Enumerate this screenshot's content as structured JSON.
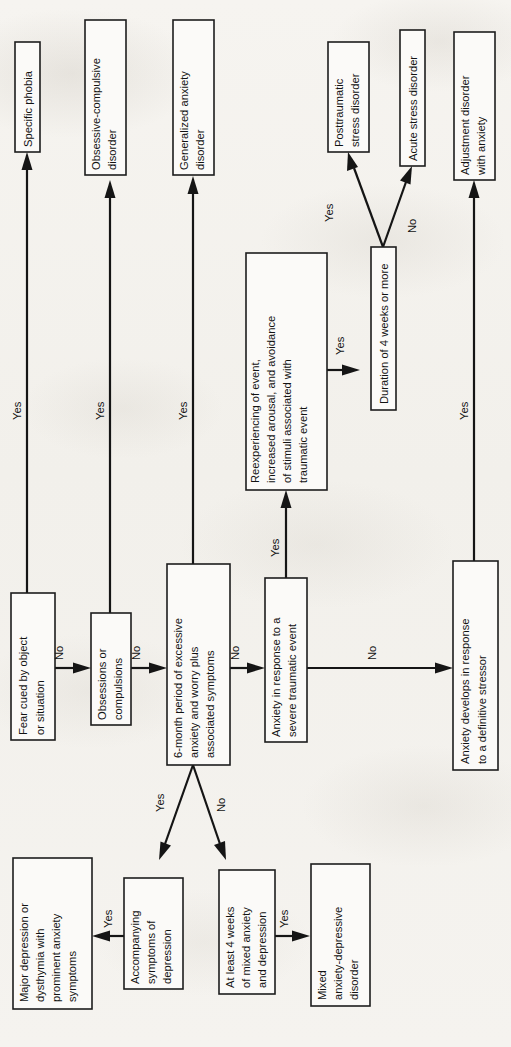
{
  "figure": {
    "orientation": "rotated-90-counterclockwise",
    "paper_color": "#f4f2ee",
    "ink_color": "#151515",
    "box_fill": "#fbfaf8"
  },
  "nodes": {
    "fear_cued": {
      "id": "fear_cued",
      "lines": [
        "Fear cued by object",
        "or situation"
      ],
      "kind": "decision"
    },
    "specific_phobia": {
      "id": "specific_phobia",
      "lines": [
        "Specific phobia"
      ],
      "kind": "outcome"
    },
    "obsessions": {
      "id": "obsessions",
      "lines": [
        "Obsessions or",
        "compulsions"
      ],
      "kind": "decision"
    },
    "ocd": {
      "id": "ocd",
      "lines": [
        "Obsessive-compulsive",
        "disorder"
      ],
      "kind": "outcome"
    },
    "six_month": {
      "id": "six_month",
      "lines": [
        "6-month period of excessive",
        "anxiety and worry plus",
        "associated symptoms"
      ],
      "kind": "decision"
    },
    "gad": {
      "id": "gad",
      "lines": [
        "Generalized anxiety",
        "disorder"
      ],
      "kind": "outcome"
    },
    "anxiety_trauma": {
      "id": "anxiety_trauma",
      "lines": [
        "Anxiety in response to a",
        "severe traumatic event"
      ],
      "kind": "decision"
    },
    "reexperiencing": {
      "id": "reexperiencing",
      "lines": [
        "Reexperiencing of event,",
        "increased arousal, and avoidance",
        "of stimuli associated with",
        "traumatic event"
      ],
      "kind": "decision"
    },
    "duration_4wk": {
      "id": "duration_4wk",
      "lines": [
        "Duration of 4 weeks or more"
      ],
      "kind": "decision"
    },
    "ptsd": {
      "id": "ptsd",
      "lines": [
        "Posttraumatic",
        "stress disorder"
      ],
      "kind": "outcome"
    },
    "acute_stress": {
      "id": "acute_stress",
      "lines": [
        "Acute stress disorder"
      ],
      "kind": "outcome"
    },
    "anxiety_stressor": {
      "id": "anxiety_stressor",
      "lines": [
        "Anxiety develops in response",
        "to a definitive stressor"
      ],
      "kind": "decision"
    },
    "adjustment": {
      "id": "adjustment",
      "lines": [
        "Adjustment disorder",
        "with anxiety"
      ],
      "kind": "outcome"
    },
    "accompanying_dep": {
      "id": "accompanying_dep",
      "lines": [
        "Accompanying",
        "symptoms of",
        "depression"
      ],
      "kind": "decision"
    },
    "major_depression": {
      "id": "major_depression",
      "lines": [
        "Major depression or",
        "dysthymia with",
        "prominent anxiety",
        "symptoms"
      ],
      "kind": "outcome"
    },
    "at_least_4wk": {
      "id": "at_least_4wk",
      "lines": [
        "At least 4 weeks",
        "of mixed anxiety",
        "and depression"
      ],
      "kind": "decision"
    },
    "mixed_disorder": {
      "id": "mixed_disorder",
      "lines": [
        "Mixed",
        "anxiety-depressive",
        "disorder"
      ],
      "kind": "outcome"
    }
  },
  "edges": [
    {
      "from": "fear_cued",
      "to": "specific_phobia",
      "label": "Yes"
    },
    {
      "from": "fear_cued",
      "to": "obsessions",
      "label": "No"
    },
    {
      "from": "obsessions",
      "to": "ocd",
      "label": "Yes"
    },
    {
      "from": "obsessions",
      "to": "six_month",
      "label": "No"
    },
    {
      "from": "six_month",
      "to": "gad",
      "label": "Yes"
    },
    {
      "from": "six_month",
      "to": "anxiety_trauma",
      "label": "No"
    },
    {
      "from": "six_month",
      "to": "accompanying_dep",
      "label": "Yes"
    },
    {
      "from": "six_month",
      "to": "at_least_4wk",
      "label": "No"
    },
    {
      "from": "anxiety_trauma",
      "to": "reexperiencing",
      "label": "Yes"
    },
    {
      "from": "anxiety_trauma",
      "to": "anxiety_stressor",
      "label": "No"
    },
    {
      "from": "reexperiencing",
      "to": "duration_4wk",
      "label": "Yes"
    },
    {
      "from": "duration_4wk",
      "to": "ptsd",
      "label": "Yes"
    },
    {
      "from": "duration_4wk",
      "to": "acute_stress",
      "label": "No"
    },
    {
      "from": "anxiety_stressor",
      "to": "adjustment",
      "label": "Yes"
    },
    {
      "from": "accompanying_dep",
      "to": "major_depression",
      "label": "Yes"
    },
    {
      "from": "at_least_4wk",
      "to": "mixed_disorder",
      "label": "Yes"
    }
  ],
  "edge_labels": {
    "fear_yes": "Yes",
    "fear_no": "No",
    "obs_yes": "Yes",
    "obs_no": "No",
    "six_yes": "Yes",
    "six_no": "No",
    "six_dep_yes": "Yes",
    "six_dep_no": "No",
    "trauma_yes": "Yes",
    "trauma_no": "No",
    "reexp_yes": "Yes",
    "dur_yes": "Yes",
    "dur_no": "No",
    "stressor_yes": "Yes",
    "accdep_yes": "Yes",
    "atleast_yes": "Yes"
  }
}
